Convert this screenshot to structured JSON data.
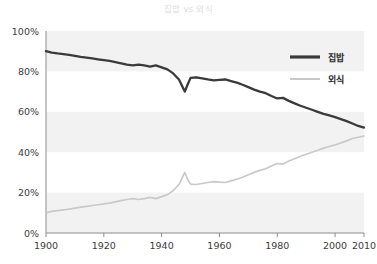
{
  "title": "집밥 vs 외식",
  "axis": {
    "y_ticks": [
      "0%",
      "20%",
      "40%",
      "60%",
      "80%",
      "100%"
    ],
    "x_ticks": [
      "1900",
      "1920",
      "1940",
      "1960",
      "1980",
      "2000",
      "2010"
    ]
  },
  "legend": {
    "items": [
      {
        "label": "집밥",
        "color": "#3a3a3a"
      },
      {
        "label": "외식",
        "color": "#c9c9c9"
      }
    ]
  },
  "colors": {
    "home": "#3a3a3a",
    "out": "#c9c9c9",
    "band": "#f2f2f2",
    "axis": "#8c8c8c",
    "title": "#dcdcdc",
    "tick_text": "#3c3c3c"
  },
  "chart_data": {
    "type": "line",
    "title": "집밥 vs 외식",
    "xlabel": "",
    "ylabel": "",
    "xlim": [
      1900,
      2010
    ],
    "ylim": [
      0,
      100
    ],
    "y_ticks": [
      0,
      20,
      40,
      60,
      80,
      100
    ],
    "x_ticks": [
      1900,
      1920,
      1940,
      1960,
      1980,
      2000,
      2010
    ],
    "y_unit": "%",
    "grid": false,
    "background_bands": true,
    "legend_position": "upper-right",
    "x": [
      1900,
      1902,
      1904,
      1906,
      1908,
      1910,
      1912,
      1914,
      1916,
      1918,
      1920,
      1922,
      1924,
      1926,
      1928,
      1930,
      1932,
      1934,
      1936,
      1938,
      1940,
      1942,
      1944,
      1946,
      1948,
      1949,
      1950,
      1952,
      1954,
      1956,
      1958,
      1960,
      1962,
      1964,
      1966,
      1968,
      1970,
      1972,
      1974,
      1976,
      1978,
      1980,
      1982,
      1984,
      1986,
      1988,
      1990,
      1992,
      1994,
      1996,
      1998,
      2000,
      2002,
      2004,
      2006,
      2008,
      2010
    ],
    "series": [
      {
        "name": "집밥",
        "color": "#3a3a3a",
        "values": [
          90.0,
          89.3,
          88.9,
          88.6,
          88.2,
          87.7,
          87.2,
          86.8,
          86.4,
          86.0,
          85.6,
          85.2,
          84.6,
          84.0,
          83.4,
          83.0,
          83.4,
          83.0,
          82.4,
          83.0,
          82.0,
          81.0,
          79.0,
          76.0,
          70.0,
          73.5,
          76.8,
          77.0,
          76.5,
          76.0,
          75.6,
          75.8,
          76.0,
          75.2,
          74.4,
          73.4,
          72.2,
          71.0,
          70.0,
          69.2,
          67.8,
          66.6,
          66.9,
          65.4,
          64.2,
          63.0,
          62.0,
          61.0,
          60.0,
          59.0,
          58.2,
          57.4,
          56.4,
          55.4,
          54.2,
          53.0,
          52.2
        ]
      },
      {
        "name": "외식",
        "color": "#c9c9c9",
        "values": [
          10.0,
          10.7,
          11.1,
          11.4,
          11.8,
          12.3,
          12.8,
          13.2,
          13.6,
          14.0,
          14.4,
          14.8,
          15.4,
          16.0,
          16.6,
          17.0,
          16.6,
          17.0,
          17.6,
          17.0,
          18.0,
          19.0,
          21.0,
          24.0,
          30.0,
          26.5,
          24.2,
          24.0,
          24.5,
          25.0,
          25.4,
          25.2,
          25.0,
          25.8,
          26.6,
          27.6,
          28.8,
          30.0,
          31.0,
          31.8,
          33.2,
          34.4,
          34.1,
          35.6,
          36.8,
          38.0,
          39.0,
          40.0,
          41.0,
          42.0,
          42.8,
          43.6,
          44.6,
          45.6,
          46.8,
          47.4,
          48.0
        ]
      }
    ]
  }
}
